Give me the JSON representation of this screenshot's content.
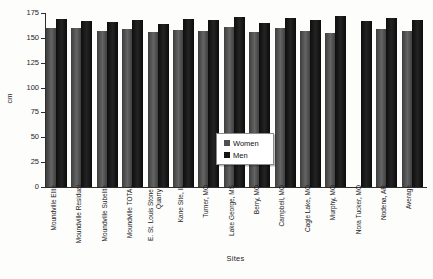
{
  "figure": {
    "y_axis_label": "cm",
    "x_axis_label": "Sites"
  },
  "chart_data": {
    "type": "bar",
    "title": "",
    "xlabel": "Sites",
    "ylabel": "cm",
    "ylim": [
      0,
      175
    ],
    "ytick_step": 25,
    "ytick_labels": [
      "0",
      "25",
      "50",
      "75",
      "100",
      "125",
      "150",
      "175"
    ],
    "grid": false,
    "legend_position": "center",
    "categories": [
      "Moundville Elite",
      "Moundville Residual",
      "Moundville Subelite",
      "Moundville TOTAL",
      "E. St. Louis Stone Quarry",
      "Kane Site, IL",
      "Turner, MO",
      "Lake George, MS",
      "Berry, MO",
      "Campbell, MO",
      "Cagle Lake, MO",
      "Murphy, MO",
      "Nora Tucker, MO",
      "Nodena, AR",
      "Average"
    ],
    "series": [
      {
        "name": "Women",
        "color": "#4f4f4f",
        "values": [
          160,
          160,
          157,
          159,
          156,
          158,
          157,
          161,
          156,
          160,
          157,
          155,
          null,
          159,
          157
        ]
      },
      {
        "name": "Men",
        "color": "#141414",
        "values": [
          169,
          167,
          166,
          168,
          164,
          169,
          168,
          171,
          165,
          170,
          168,
          172,
          167,
          170,
          168
        ]
      }
    ]
  }
}
